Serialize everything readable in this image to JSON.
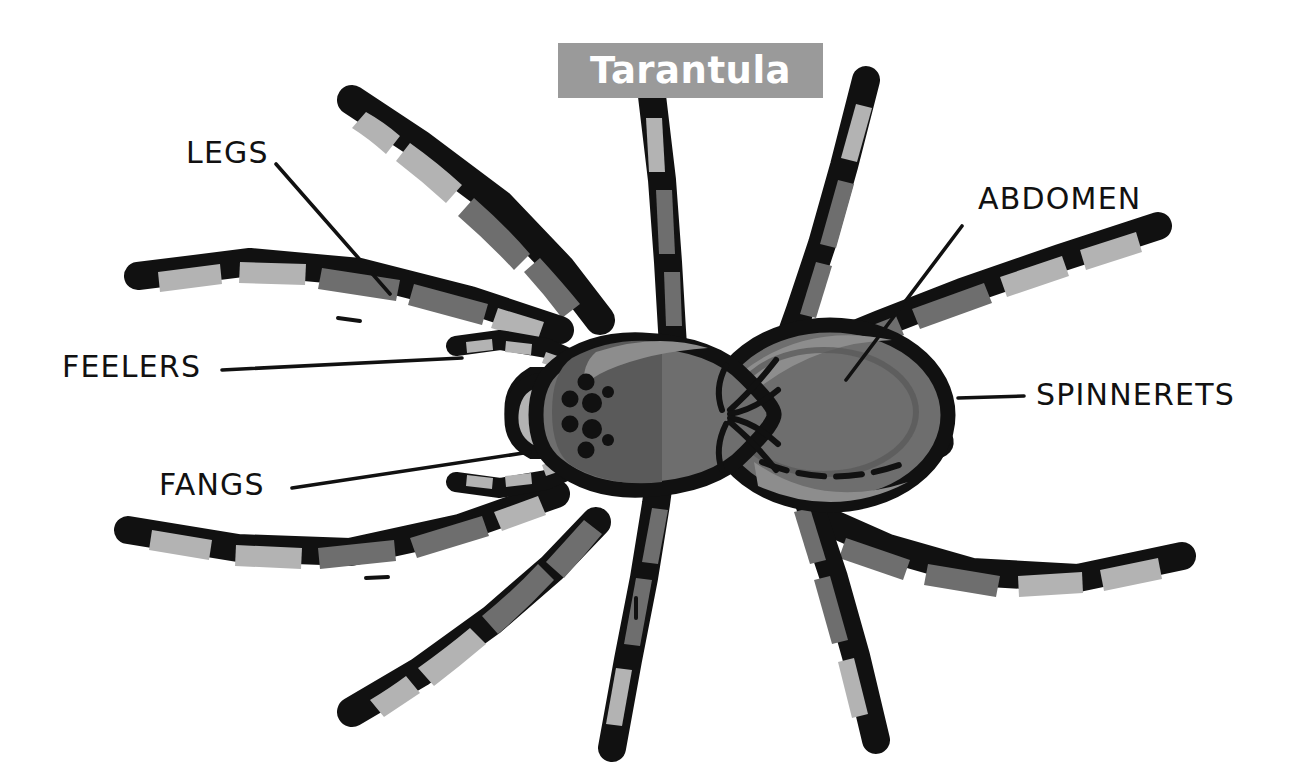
{
  "page": {
    "background_color": "#ffffff",
    "width": 1299,
    "height": 777
  },
  "title": {
    "text": "Tarantula",
    "banner_color": "#9a9a9a",
    "text_color": "#ffffff"
  },
  "palette": {
    "outline": "#111111",
    "body_mid_gray": "#6e6e6e",
    "body_dark_gray": "#5a5a5a",
    "segment_light_gray": "#b3b3b3",
    "highlight_gray": "#8d8d8d",
    "banner_gray": "#9a9a9a",
    "white": "#ffffff"
  },
  "labels": [
    {
      "id": "legs",
      "text": "LEGS"
    },
    {
      "id": "feelers",
      "text": "FEELERS"
    },
    {
      "id": "fangs",
      "text": "FANGS"
    },
    {
      "id": "abdomen",
      "text": "ABDOMEN"
    },
    {
      "id": "spinnerets",
      "text": "SPINNERETS"
    }
  ],
  "anatomy": {
    "parts": [
      "cephalothorax",
      "abdomen",
      "eight legs",
      "pedipalps (feelers)",
      "chelicerae with fangs",
      "spinnerets",
      "eye cluster"
    ],
    "leg_count": 8,
    "eye_count": 8
  }
}
